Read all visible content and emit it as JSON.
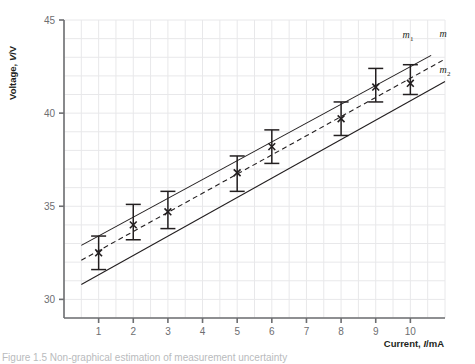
{
  "figure": {
    "caption": "Figure 1.5 Non-graphical estimation of measurement uncertainty"
  },
  "chart_data": {
    "type": "scatter",
    "title": "",
    "xlabel": "Current, I/mA",
    "ylabel": "Voltage, V/V",
    "xlim": [
      0,
      11
    ],
    "ylim": [
      29,
      45
    ],
    "xticks": [
      1,
      2,
      3,
      4,
      5,
      6,
      7,
      8,
      9,
      10
    ],
    "yticks": [
      30,
      35,
      40,
      45
    ],
    "grid": true,
    "grid_color": "#e8e8ea",
    "axis_color": "#6d6e71",
    "data_color": "#231f20",
    "legend_position": "right-inline",
    "points": [
      {
        "x": 1,
        "y": 32.5,
        "yerr_low": 31.6,
        "yerr_high": 33.4
      },
      {
        "x": 2,
        "y": 34.0,
        "yerr_low": 33.2,
        "yerr_high": 35.1
      },
      {
        "x": 3,
        "y": 34.7,
        "yerr_low": 33.8,
        "yerr_high": 35.8
      },
      {
        "x": 5,
        "y": 36.8,
        "yerr_low": 35.8,
        "yerr_high": 37.7
      },
      {
        "x": 6,
        "y": 38.2,
        "yerr_low": 37.3,
        "yerr_high": 39.1
      },
      {
        "x": 8,
        "y": 39.7,
        "yerr_low": 38.8,
        "yerr_high": 40.6
      },
      {
        "x": 9,
        "y": 41.4,
        "yerr_low": 40.6,
        "yerr_high": 42.4
      },
      {
        "x": 10,
        "y": 41.6,
        "yerr_low": 41.0,
        "yerr_high": 42.6
      }
    ],
    "lines": [
      {
        "name": "m1",
        "label": "m",
        "label_sub": "1",
        "style": "solid",
        "x0": 0.5,
        "y0": 32.9,
        "x1": 10.6,
        "y1": 43.1
      },
      {
        "name": "m",
        "label": "m",
        "label_sub": "",
        "style": "dashed",
        "x0": 0.5,
        "y0": 32.1,
        "x1": 11.0,
        "y1": 42.9
      },
      {
        "name": "m2",
        "label": "m",
        "label_sub": "2",
        "style": "solid",
        "x0": 0.5,
        "y0": 30.8,
        "x1": 11.0,
        "y1": 41.7
      }
    ]
  }
}
